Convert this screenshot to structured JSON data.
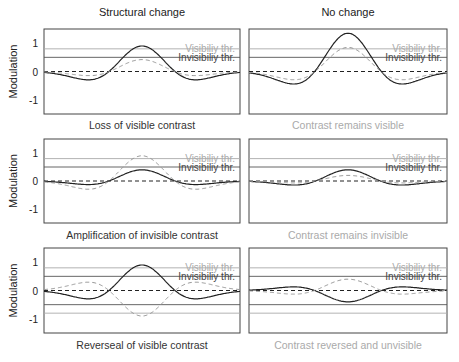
{
  "chart_data": [
    {
      "type": "line",
      "title": "Structural change",
      "caption": "Loss of visible contrast",
      "ylabel": "Modulation",
      "ylim": [
        -1.5,
        1.5
      ],
      "yticks": [
        "1",
        "0",
        "-1"
      ],
      "thresholds": [
        {
          "name": "Visibiliy thr.",
          "value": 0.8
        },
        {
          "name": "Invisibiliy thr.",
          "value": 0.5
        }
      ],
      "series": [
        {
          "name": "solid",
          "peak": 0.9,
          "side": -0.3
        },
        {
          "name": "dashed",
          "peak": 0.42,
          "side": -0.15
        }
      ]
    },
    {
      "type": "line",
      "title": "No change",
      "caption": "Contrast remains visible",
      "ylim": [
        -1.5,
        1.5
      ],
      "thresholds": [
        {
          "name": "Visibiliy thr.",
          "value": 0.8
        },
        {
          "name": "Invisibiliy thr.",
          "value": 0.5
        }
      ],
      "series": [
        {
          "name": "solid",
          "peak": 1.35,
          "side": -0.45
        },
        {
          "name": "dashed",
          "peak": 0.85,
          "side": -0.3
        }
      ]
    },
    {
      "type": "line",
      "caption": "Amplification of invisible contrast",
      "ylabel": "Modulation",
      "ylim": [
        -1.5,
        1.5
      ],
      "yticks": [
        "1",
        "0",
        "-1"
      ],
      "thresholds": [
        {
          "name": "Visibiliy thr.",
          "value": 0.8
        },
        {
          "name": "Invisibiliy thr.",
          "value": 0.5
        }
      ],
      "series": [
        {
          "name": "solid",
          "peak": 0.4,
          "side": -0.13
        },
        {
          "name": "dashed",
          "peak": 0.9,
          "side": -0.3
        }
      ]
    },
    {
      "type": "line",
      "caption": "Contrast remains invisible",
      "ylim": [
        -1.5,
        1.5
      ],
      "thresholds": [
        {
          "name": "Visibiliy thr.",
          "value": 0.8
        },
        {
          "name": "Invisibiliy thr.",
          "value": 0.5
        }
      ],
      "series": [
        {
          "name": "solid",
          "peak": 0.4,
          "side": -0.15
        },
        {
          "name": "dashed",
          "peak": 0.2,
          "side": -0.07
        }
      ]
    },
    {
      "type": "line",
      "caption": "Reverseal of visible contrast",
      "ylabel": "Modulation",
      "ylim": [
        -1.5,
        1.5
      ],
      "yticks": [
        "1",
        "0",
        "-1"
      ],
      "thresholds": [
        {
          "name": "Visibiliy thr.",
          "value": 0.8
        },
        {
          "name": "Invisibiliy thr.",
          "value": 0.5
        },
        {
          "name": "",
          "value": -0.5
        },
        {
          "name": "",
          "value": -0.8
        }
      ],
      "series": [
        {
          "name": "solid",
          "peak": 0.9,
          "side": -0.3
        },
        {
          "name": "dashed",
          "peak": -0.9,
          "side": 0.3
        }
      ]
    },
    {
      "type": "line",
      "caption": "Contrast reversed and unvisible",
      "ylim": [
        -1.5,
        1.5
      ],
      "thresholds": [
        {
          "name": "Visibiliy thr.",
          "value": 0.8
        },
        {
          "name": "Invisibiliy thr.",
          "value": 0.5
        },
        {
          "name": "",
          "value": -0.5
        },
        {
          "name": "",
          "value": -0.8
        }
      ],
      "series": [
        {
          "name": "solid",
          "peak": -0.4,
          "side": 0.13
        },
        {
          "name": "dashed",
          "peak": 0.4,
          "side": -0.13
        }
      ]
    }
  ],
  "labels": {
    "col_left": "Structural change",
    "col_right": "No change",
    "ylabel": "Modulation",
    "vis": "Visibiliy thr.",
    "invis": "Invisibiliy thr.",
    "cap": [
      "Loss of visible contrast",
      "Contrast remains visible",
      "Amplification of invisible contrast",
      "Contrast remains invisible",
      "Reverseal of visible contrast",
      "Contrast reversed and unvisible"
    ],
    "t1": "1",
    "t0": "0",
    "tm1": "-1"
  }
}
